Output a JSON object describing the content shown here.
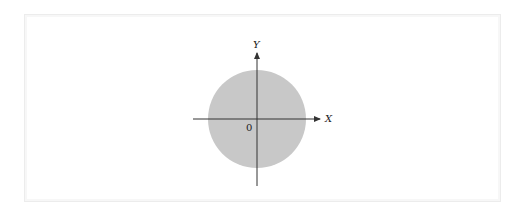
{
  "diagram": {
    "type": "coordinate-plane-disk",
    "axes": {
      "x_label": "X",
      "y_label": "Y",
      "origin_label": "0"
    },
    "shape": {
      "kind": "circle",
      "fill_color": "#c8c8c8",
      "center": "origin"
    },
    "colors": {
      "axis": "#333333",
      "frame": "#ececec",
      "background": "#ffffff"
    }
  }
}
